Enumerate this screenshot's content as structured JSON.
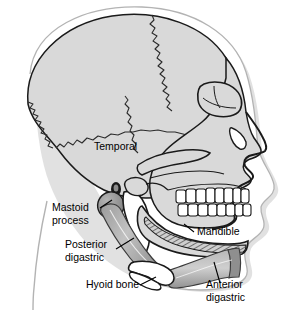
{
  "figure": {
    "view": "left lateral profile, facing right",
    "background_color": "#ffffff",
    "bone_fill_color": "#d9d9d9",
    "bone_outline_color": "#1a1a1a",
    "muscle_fill_color": "#a8a8a8",
    "muscle_dark_color": "#8a8a8a",
    "tooth_fill_color": "#ffffff",
    "shadow_color": "#c9c9c9",
    "soft_tissue_outline_color": "#b0b0b0",
    "label_text_color": "#000000",
    "leader_line_color": "#000000"
  },
  "labels": [
    {
      "id": "temporal",
      "lines": [
        "Temporal"
      ],
      "x": 94,
      "y": 150,
      "anchor": "start",
      "has_leader": false,
      "describes": "temporal bone of the cranium"
    },
    {
      "id": "mastoid-process",
      "lines": [
        "Mastoid",
        "process"
      ],
      "x": 52,
      "y": 211,
      "anchor": "start",
      "has_leader": true,
      "describes": "mastoid process of the temporal bone"
    },
    {
      "id": "posterior-digastric",
      "lines": [
        "Posterior",
        "digastric"
      ],
      "x": 65,
      "y": 248,
      "anchor": "start",
      "has_leader": true,
      "describes": "posterior belly of the digastric muscle"
    },
    {
      "id": "hyoid-bone",
      "lines": [
        "Hyoid bone"
      ],
      "x": 86,
      "y": 288,
      "anchor": "start",
      "has_leader": true,
      "describes": "hyoid bone"
    },
    {
      "id": "mandible",
      "lines": [
        "Mandible"
      ],
      "x": 197,
      "y": 235,
      "anchor": "start",
      "has_leader": true,
      "describes": "mandible, the lower jaw bone"
    },
    {
      "id": "anterior-digastric",
      "lines": [
        "Anterior",
        "digastric"
      ],
      "x": 206,
      "y": 288,
      "anchor": "start",
      "has_leader": true,
      "describes": "anterior belly of the digastric muscle"
    }
  ],
  "structures": {
    "cranium": "cranial vault with zigzag suture lines",
    "sutures": [
      "coronal suture",
      "lambdoid suture",
      "squamous suture",
      "parieto-occipital region"
    ],
    "orbit": "eye socket",
    "nasal_aperture": "nasal opening",
    "zygomatic_arch": "cheek bone arch",
    "ear_canal": "external acoustic meatus",
    "teeth_upper_count": 8,
    "teeth_lower_count": 8,
    "soft_tissue_profile": "nose, lips and chin outline",
    "neck_outline": "posterior neck curve"
  }
}
